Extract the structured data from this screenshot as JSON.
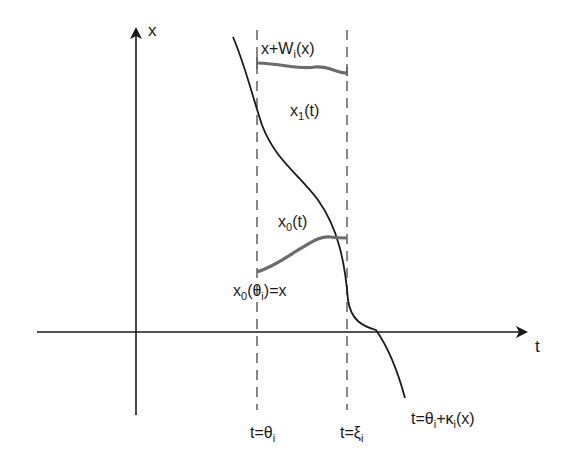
{
  "diagram": {
    "axes": {
      "vertical_label": "x",
      "horizontal_label": "t"
    },
    "curves": {
      "upper_curve": {
        "name": "x1(t)",
        "main": "x",
        "sub": "1",
        "rest": "(t)"
      },
      "upper_start": {
        "main": "x+W",
        "sub": "i",
        "rest": "(x)"
      },
      "lower_curve": {
        "name": "x0(t)",
        "main": "x",
        "sub": "0",
        "rest": "(t)"
      },
      "lower_start": {
        "main": "x",
        "sub": "0",
        "mid": "(θ",
        "sub2": "i",
        "rest": ")=x"
      }
    },
    "markers": {
      "left_dashed": {
        "main": "t=θ",
        "sub": "i"
      },
      "right_dashed": {
        "main": "t=ξ",
        "sub": "i"
      },
      "crossing": {
        "main": "t=θ",
        "sub": "i",
        "mid": "+κ",
        "sub2": "i",
        "rest": "(x)"
      }
    },
    "colors": {
      "axis": "#1a1a1a",
      "main_curve": "#1a1a1a",
      "solution_curves": "#6b6b6b",
      "dashed": "#555555"
    }
  }
}
